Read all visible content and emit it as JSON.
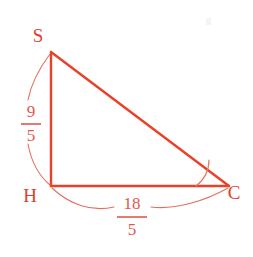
{
  "figure": {
    "kind": "right-triangle-geometry-diagram",
    "background_color": "#ffffff",
    "line_color": "#e8402a",
    "arc_color": "#e27060",
    "label_color": "#e0402c",
    "vertices": [
      {
        "name": "S",
        "label": "S",
        "x": 51,
        "y": 52,
        "label_x": 38,
        "label_y": 42
      },
      {
        "name": "H",
        "label": "H",
        "x": 51,
        "y": 186,
        "label_x": 30,
        "label_y": 202
      },
      {
        "name": "C",
        "label": "C",
        "x": 229,
        "y": 186,
        "label_x": 234,
        "label_y": 199
      }
    ],
    "right_angle_at": "H",
    "marked_angle_at": "C",
    "measurements": {
      "leg_SH": {
        "numerator": "9",
        "denominator": "5",
        "side": "S-H",
        "position": "left",
        "num_x": 31,
        "num_y": 117,
        "den_x": 31,
        "den_y": 141,
        "bar_x1": 21,
        "bar_x2": 41,
        "bar_y": 124
      },
      "leg_HC": {
        "numerator": "18",
        "denominator": "5",
        "side": "H-C",
        "position": "below",
        "num_x": 132,
        "num_y": 209,
        "den_x": 132,
        "den_y": 235,
        "bar_x1": 117,
        "bar_x2": 147,
        "bar_y": 217
      }
    }
  }
}
